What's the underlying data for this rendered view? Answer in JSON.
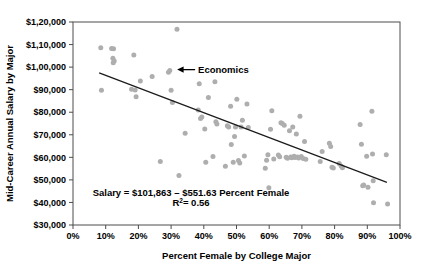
{
  "chart_data": {
    "type": "scatter",
    "title": "",
    "xlabel": "Percent Female by College Major",
    "ylabel": "Mid-Career Annual Salary by Major",
    "xlim": [
      0,
      100
    ],
    "ylim": [
      30000,
      120000
    ],
    "grid": false,
    "legend": null,
    "x_tick_labels": [
      "0%",
      "10%",
      "20%",
      "30%",
      "40%",
      "50%",
      "60%",
      "70%",
      "80%",
      "90%",
      "100%"
    ],
    "x_tick_values": [
      0,
      10,
      20,
      30,
      40,
      50,
      60,
      70,
      80,
      90,
      100
    ],
    "y_tick_labels": [
      "$1,20,000",
      "$1,10,000",
      "$1,00,000",
      "$90,000",
      "$80,000",
      "$70,000",
      "$60,000",
      "$50,000",
      "$40,000",
      "$30,000"
    ],
    "y_tick_values": [
      120000,
      110000,
      100000,
      90000,
      80000,
      70000,
      60000,
      50000,
      40000,
      30000
    ],
    "marker_color": "#aeaeae",
    "trendline_color": "#1a1a1a",
    "annotations": [
      {
        "name": "economics",
        "label": "Economics",
        "point_x": 30,
        "point_y": 98000
      }
    ],
    "equation": {
      "line1": "Salary = $101,863 – $551.63 Percent Female",
      "r2_prefix": "R",
      "r2_exponent": "2",
      "r2_value": "= 0.56"
    },
    "trendline": {
      "intercept": 101863,
      "slope": -551.63,
      "x_start": 8,
      "x_end": 96
    },
    "points": [
      [
        8.5,
        108600
      ],
      [
        8.7,
        89700
      ],
      [
        11.8,
        108300
      ],
      [
        12.4,
        108100
      ],
      [
        12.2,
        103900
      ],
      [
        12.6,
        102700
      ],
      [
        12.3,
        101900
      ],
      [
        17.9,
        90200
      ],
      [
        18.6,
        105400
      ],
      [
        19.3,
        86900
      ],
      [
        19.0,
        89900
      ],
      [
        20.6,
        93800
      ],
      [
        24.2,
        95800
      ],
      [
        26.7,
        58200
      ],
      [
        29.2,
        97700
      ],
      [
        29.6,
        98500
      ],
      [
        30.0,
        89700
      ],
      [
        30.4,
        84300
      ],
      [
        31.8,
        116800
      ],
      [
        32.4,
        51900
      ],
      [
        34.3,
        70700
      ],
      [
        38.3,
        81000
      ],
      [
        38.6,
        92600
      ],
      [
        39.0,
        77200
      ],
      [
        39.4,
        77900
      ],
      [
        40.3,
        72600
      ],
      [
        40.6,
        57800
      ],
      [
        41.4,
        86500
      ],
      [
        42.8,
        60400
      ],
      [
        43.4,
        93500
      ],
      [
        43.7,
        75800
      ],
      [
        44.0,
        74800
      ],
      [
        46.6,
        56000
      ],
      [
        47.2,
        74000
      ],
      [
        47.6,
        73400
      ],
      [
        48.2,
        82600
      ],
      [
        48.4,
        65700
      ],
      [
        49.0,
        57800
      ],
      [
        49.4,
        69200
      ],
      [
        49.7,
        73500
      ],
      [
        50.1,
        85800
      ],
      [
        50.6,
        58600
      ],
      [
        51.0,
        57500
      ],
      [
        51.4,
        73400
      ],
      [
        51.8,
        76400
      ],
      [
        52.4,
        60600
      ],
      [
        53.2,
        83600
      ],
      [
        53.6,
        73200
      ],
      [
        58.8,
        55200
      ],
      [
        59.2,
        58700
      ],
      [
        59.6,
        61200
      ],
      [
        59.9,
        46500
      ],
      [
        60.4,
        72500
      ],
      [
        60.8,
        80600
      ],
      [
        61.4,
        59300
      ],
      [
        62.8,
        61000
      ],
      [
        63.2,
        60300
      ],
      [
        63.6,
        75300
      ],
      [
        64.0,
        75000
      ],
      [
        64.6,
        74200
      ],
      [
        65.2,
        60000
      ],
      [
        65.6,
        59600
      ],
      [
        66.2,
        71800
      ],
      [
        66.6,
        60200
      ],
      [
        66.9,
        59800
      ],
      [
        67.2,
        73500
      ],
      [
        67.6,
        60500
      ],
      [
        67.9,
        59900
      ],
      [
        68.3,
        70300
      ],
      [
        68.6,
        60100
      ],
      [
        69.0,
        59700
      ],
      [
        69.4,
        78200
      ],
      [
        69.8,
        60400
      ],
      [
        70.4,
        59500
      ],
      [
        70.8,
        67000
      ],
      [
        71.2,
        59200
      ],
      [
        75.6,
        58200
      ],
      [
        76.2,
        62600
      ],
      [
        78.4,
        66200
      ],
      [
        78.8,
        64800
      ],
      [
        79.2,
        55600
      ],
      [
        79.6,
        55300
      ],
      [
        81.4,
        57300
      ],
      [
        82.0,
        56200
      ],
      [
        82.4,
        55400
      ],
      [
        87.8,
        74600
      ],
      [
        88.2,
        65800
      ],
      [
        88.6,
        47400
      ],
      [
        88.9,
        47700
      ],
      [
        89.8,
        60500
      ],
      [
        90.2,
        46700
      ],
      [
        91.4,
        80400
      ],
      [
        91.6,
        61500
      ],
      [
        91.8,
        49600
      ],
      [
        91.9,
        39900
      ],
      [
        95.8,
        61100
      ],
      [
        96.2,
        39300
      ]
    ]
  }
}
